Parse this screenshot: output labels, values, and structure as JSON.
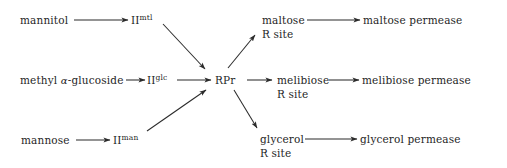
{
  "diagram": {
    "stroke_color": "#2b2b2b",
    "background": "#ffffff",
    "nodes": [
      {
        "id": "mannitol",
        "text": "mannitol",
        "x": 20,
        "y": 14
      },
      {
        "id": "ii-mtl-base",
        "text": "II",
        "sup": "mtl",
        "x": 131,
        "y": 14
      },
      {
        "id": "methyl-glucoside",
        "text": "methyl ",
        "alpha": "α",
        "text2": "-glucoside",
        "x": 20,
        "y": 74
      },
      {
        "id": "ii-glc-base",
        "text": "II",
        "sup": "glc",
        "x": 147,
        "y": 74
      },
      {
        "id": "mannose",
        "text": "mannose",
        "x": 21,
        "y": 134
      },
      {
        "id": "ii-man-base",
        "text": "II",
        "sup": "man",
        "x": 113,
        "y": 134
      },
      {
        "id": "rpr",
        "text": "RPr",
        "x": 215,
        "y": 74
      },
      {
        "id": "maltose",
        "text": "maltose",
        "x": 262,
        "y": 14
      },
      {
        "id": "maltose-r-site",
        "text": "R site",
        "x": 262,
        "y": 28
      },
      {
        "id": "maltose-permease",
        "text": "maltose permease",
        "x": 363,
        "y": 14
      },
      {
        "id": "melibiose",
        "text": "melibiose",
        "x": 277,
        "y": 74
      },
      {
        "id": "melibiose-r-site",
        "text": "R site",
        "x": 277,
        "y": 88
      },
      {
        "id": "melibiose-permease",
        "text": "melibiose permease",
        "x": 362,
        "y": 74
      },
      {
        "id": "glycerol",
        "text": "glycerol",
        "x": 260,
        "y": 133
      },
      {
        "id": "glycerol-r-site",
        "text": "R site",
        "x": 260,
        "y": 147
      },
      {
        "id": "glycerol-permease",
        "text": "glycerol permease",
        "x": 360,
        "y": 133
      }
    ],
    "edges": [
      {
        "id": "mannitol-to-ii-mtl",
        "from": "mannitol",
        "to": "ii-mtl",
        "x1": 74,
        "y1": 20,
        "x2": 128,
        "y2": 20
      },
      {
        "id": "methyl-glucoside-to-ii-glc",
        "from": "methyl-glucoside",
        "to": "ii-glc",
        "x1": 126,
        "y1": 80,
        "x2": 145,
        "y2": 80
      },
      {
        "id": "mannose-to-ii-man",
        "from": "mannose",
        "to": "ii-man",
        "x1": 76,
        "y1": 140,
        "x2": 110,
        "y2": 140
      },
      {
        "id": "ii-mtl-to-rpr",
        "from": "ii-mtl",
        "to": "rpr",
        "x1": 163,
        "y1": 24,
        "x2": 205,
        "y2": 69
      },
      {
        "id": "ii-glc-to-rpr",
        "from": "ii-glc",
        "to": "rpr",
        "x1": 177,
        "y1": 80,
        "x2": 211,
        "y2": 80
      },
      {
        "id": "ii-man-to-rpr",
        "from": "ii-man",
        "to": "rpr",
        "x1": 147,
        "y1": 131,
        "x2": 206,
        "y2": 90
      },
      {
        "id": "rpr-to-maltose-r-site",
        "from": "rpr",
        "to": "maltose-r-site",
        "x1": 228,
        "y1": 68,
        "x2": 255,
        "y2": 35
      },
      {
        "id": "rpr-to-melibiose-r-site",
        "from": "rpr",
        "to": "melibiose-r-site",
        "x1": 247,
        "y1": 80,
        "x2": 272,
        "y2": 80
      },
      {
        "id": "rpr-to-glycerol-r-site",
        "from": "rpr",
        "to": "glycerol-r-site",
        "x1": 234,
        "y1": 90,
        "x2": 257,
        "y2": 128
      },
      {
        "id": "maltose-to-permease",
        "from": "maltose",
        "to": "maltose-permease",
        "x1": 307,
        "y1": 20,
        "x2": 360,
        "y2": 20
      },
      {
        "id": "melibiose-to-permease",
        "from": "melibiose",
        "to": "melibiose-permease",
        "x1": 329,
        "y1": 80,
        "x2": 359,
        "y2": 80
      },
      {
        "id": "glycerol-to-permease",
        "from": "glycerol",
        "to": "glycerol-permease",
        "x1": 305,
        "y1": 139,
        "x2": 357,
        "y2": 139
      }
    ]
  }
}
